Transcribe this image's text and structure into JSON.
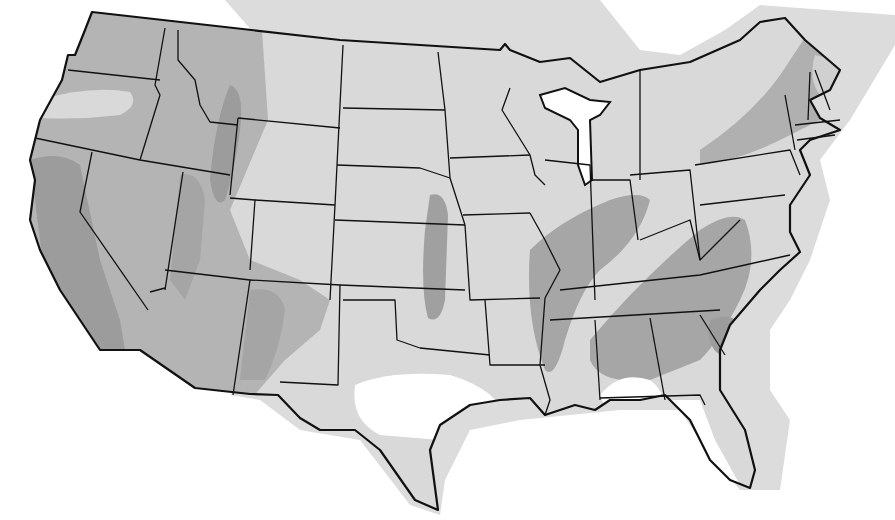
{
  "map": {
    "title": "",
    "subject": "Contiguous United States shaded zone map",
    "colors": {
      "background": "#ffffff",
      "zone_light": "#d9d9d9",
      "zone_medium": "#b4b4b4",
      "zone_dark": "#9c9c9c",
      "water_lakes": "#ffffff",
      "unshaded": "#ffffff",
      "border": "#111111"
    },
    "zones": [
      {
        "name": "light",
        "color": "#d9d9d9"
      },
      {
        "name": "medium",
        "color": "#b4b4b4"
      },
      {
        "name": "dark",
        "color": "#9c9c9c"
      },
      {
        "name": "none",
        "color": "#ffffff"
      }
    ],
    "labels": []
  }
}
